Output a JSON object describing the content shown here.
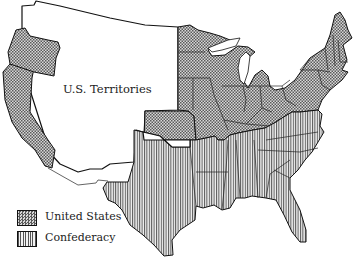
{
  "map": {
    "regions": [
      {
        "name": "United States",
        "pattern": "crosshatch"
      },
      {
        "name": "Confederacy",
        "pattern": "vertical-stripes"
      },
      {
        "name": "U.S. Territories",
        "pattern": "blank"
      }
    ],
    "territory_label": "U.S. Territories"
  },
  "legend": {
    "items": [
      {
        "label": "United States",
        "pattern": "crosshatch"
      },
      {
        "label": "Confederacy",
        "pattern": "vertical-stripes"
      }
    ]
  },
  "colors": {
    "outline": "#111111",
    "pattern_dark": "#555555",
    "background": "#ffffff"
  }
}
